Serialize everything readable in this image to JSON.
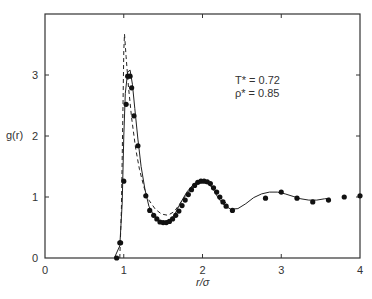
{
  "chart_data": {
    "type": "line",
    "title": "",
    "xlabel": "r/σ",
    "ylabel": "g(r)",
    "xlim": [
      0,
      4
    ],
    "ylim": [
      0,
      3.95
    ],
    "grid": false,
    "x_ticks": [
      "0",
      "1",
      "2",
      "3",
      "4"
    ],
    "y_ticks": [
      "0",
      "1",
      "2",
      "3"
    ],
    "annotations": [
      "T* = 0.72",
      "ρ* = 0.85"
    ],
    "series": [
      {
        "name": "solid curve",
        "style": "solid",
        "x": [
          0.88,
          0.95,
          0.98,
          1.0,
          1.02,
          1.05,
          1.08,
          1.11,
          1.14,
          1.18,
          1.22,
          1.27,
          1.32,
          1.38,
          1.45,
          1.52,
          1.58,
          1.65,
          1.72,
          1.8,
          1.88,
          1.95,
          2.02,
          2.08,
          2.14,
          2.2,
          2.28,
          2.36,
          2.45,
          2.55,
          2.65,
          2.75,
          2.85,
          2.95,
          3.05,
          3.15,
          3.25,
          3.35,
          3.45,
          3.55,
          3.62
        ],
        "y": [
          0.0,
          0.2,
          0.9,
          2.0,
          2.7,
          3.05,
          3.08,
          2.85,
          2.45,
          1.95,
          1.5,
          1.12,
          0.85,
          0.7,
          0.6,
          0.57,
          0.6,
          0.72,
          0.9,
          1.08,
          1.2,
          1.26,
          1.27,
          1.23,
          1.12,
          0.98,
          0.86,
          0.8,
          0.81,
          0.89,
          0.99,
          1.05,
          1.08,
          1.08,
          1.05,
          1.01,
          0.97,
          0.95,
          0.95,
          0.97,
          0.98
        ]
      },
      {
        "name": "dashed curve",
        "style": "dashed",
        "x": [
          0.95,
          0.97,
          0.99,
          1.0,
          1.01,
          1.03,
          1.06,
          1.1,
          1.15,
          1.2,
          1.26,
          1.32,
          1.4,
          1.48,
          1.56,
          1.64,
          1.72,
          1.8,
          1.88,
          1.95,
          2.02,
          2.08,
          2.15,
          2.22,
          2.3
        ],
        "y": [
          0.0,
          0.8,
          2.5,
          3.4,
          3.67,
          3.3,
          2.8,
          2.3,
          1.8,
          1.45,
          1.15,
          0.95,
          0.8,
          0.72,
          0.7,
          0.76,
          0.9,
          1.05,
          1.17,
          1.23,
          1.24,
          1.21,
          1.12,
          1.0,
          0.9
        ]
      },
      {
        "name": "simulation points",
        "style": "markers",
        "x": [
          0.91,
          0.95,
          0.96,
          1.0,
          1.03,
          1.05,
          1.08,
          1.1,
          1.13,
          1.18,
          1.28,
          1.33,
          1.38,
          1.42,
          1.46,
          1.5,
          1.54,
          1.58,
          1.62,
          1.66,
          1.7,
          1.74,
          1.78,
          1.82,
          1.86,
          1.9,
          1.94,
          1.98,
          2.02,
          2.06,
          2.1,
          2.14,
          2.18,
          2.22,
          2.26,
          2.3,
          2.38,
          2.8,
          3.0,
          3.2,
          3.4,
          3.6,
          3.8,
          4.0
        ],
        "y": [
          0.0,
          0.25,
          0.25,
          1.26,
          2.52,
          2.98,
          2.98,
          2.79,
          2.33,
          1.84,
          1.02,
          0.78,
          0.7,
          0.64,
          0.59,
          0.58,
          0.58,
          0.6,
          0.64,
          0.7,
          0.77,
          0.86,
          0.95,
          1.04,
          1.12,
          1.19,
          1.24,
          1.26,
          1.26,
          1.25,
          1.22,
          1.15,
          1.08,
          1.0,
          0.92,
          0.85,
          0.78,
          0.98,
          1.08,
          0.98,
          0.92,
          0.95,
          1.0,
          1.02
        ]
      }
    ]
  }
}
